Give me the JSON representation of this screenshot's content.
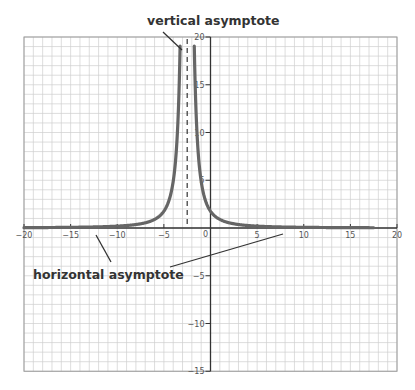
{
  "chart_data": {
    "type": "line",
    "title": "",
    "xlabel": "",
    "ylabel": "",
    "xlim": [
      -20,
      20
    ],
    "ylim": [
      -15,
      20
    ],
    "grid": true,
    "grid_minor_step": 1,
    "x_ticks": [
      -20,
      -15,
      -10,
      -5,
      0,
      5,
      10,
      15,
      20
    ],
    "x_tick_labels": [
      "−20",
      "−15",
      "−10",
      "−5",
      "0",
      "5",
      "10",
      "15",
      "20"
    ],
    "y_ticks": [
      20,
      15,
      10,
      5,
      -5,
      -10,
      -15
    ],
    "y_tick_labels": [
      "20",
      "15",
      "10",
      "5",
      "−5",
      "−10",
      "−15"
    ],
    "series": [
      {
        "name": "curve",
        "function": "y = 11 / (x + 2.5)^2",
        "x_range": [
          -20,
          17.5
        ],
        "points": [
          [
            -20,
            0.04
          ],
          [
            -15,
            0.07
          ],
          [
            -12,
            0.12
          ],
          [
            -10,
            0.2
          ],
          [
            -8,
            0.36
          ],
          [
            -6,
            0.9
          ],
          [
            -5,
            1.76
          ],
          [
            -4.5,
            2.75
          ],
          [
            -4,
            4.9
          ],
          [
            -3.5,
            11.0
          ],
          [
            -3.26,
            19.0
          ],
          [
            -1.74,
            19.0
          ],
          [
            -1.5,
            11.0
          ],
          [
            -1,
            4.9
          ],
          [
            -0.5,
            2.75
          ],
          [
            0,
            1.76
          ],
          [
            1,
            0.9
          ],
          [
            3,
            0.36
          ],
          [
            5,
            0.2
          ],
          [
            7,
            0.12
          ],
          [
            10,
            0.07
          ],
          [
            15,
            0.04
          ],
          [
            17.5,
            0.03
          ]
        ],
        "color": "#666666"
      }
    ],
    "asymptotes": {
      "vertical": {
        "x": -2.5,
        "style": "dashed"
      },
      "horizontal": {
        "y": 0
      }
    },
    "annotations": [
      {
        "text": "vertical asymptote",
        "points_to": "vertical asymptote line"
      },
      {
        "text": "horizontal asymptote",
        "points_to": "x-axis (y = 0) on both sides"
      }
    ]
  },
  "labels": {
    "vertical_asymptote": "vertical asymptote",
    "horizontal_asymptote": "horizontal asymptote"
  },
  "colors": {
    "grid": "#cfcfcf",
    "frame": "#9a9a9a",
    "axis": "#333333",
    "curve": "#666666",
    "annotation": "#333333"
  }
}
